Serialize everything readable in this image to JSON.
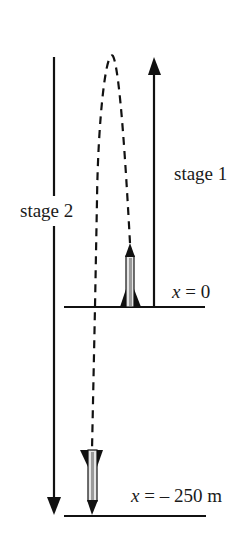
{
  "diagram": {
    "type": "rocket motion diagram",
    "labels": {
      "stage1": "stage 1",
      "stage2": "stage 2",
      "upper_position_var": "x",
      "upper_position_rest": " = 0",
      "lower_position_var": "x",
      "lower_position_rest": " = – 250 m"
    },
    "elements": {
      "upper_ground": "ground line at x = 0",
      "lower_ground": "ground line at x = -250 m",
      "stage1_arrow": "upward arrow",
      "stage2_arrow": "downward arrow",
      "trajectory": "dashed path",
      "rocket_launch": "rocket pointing up",
      "rocket_landing": "rocket pointing down"
    },
    "colors": {
      "ink": "#111111",
      "rocket_body": "#d9d9d9",
      "background": "#ffffff"
    }
  }
}
